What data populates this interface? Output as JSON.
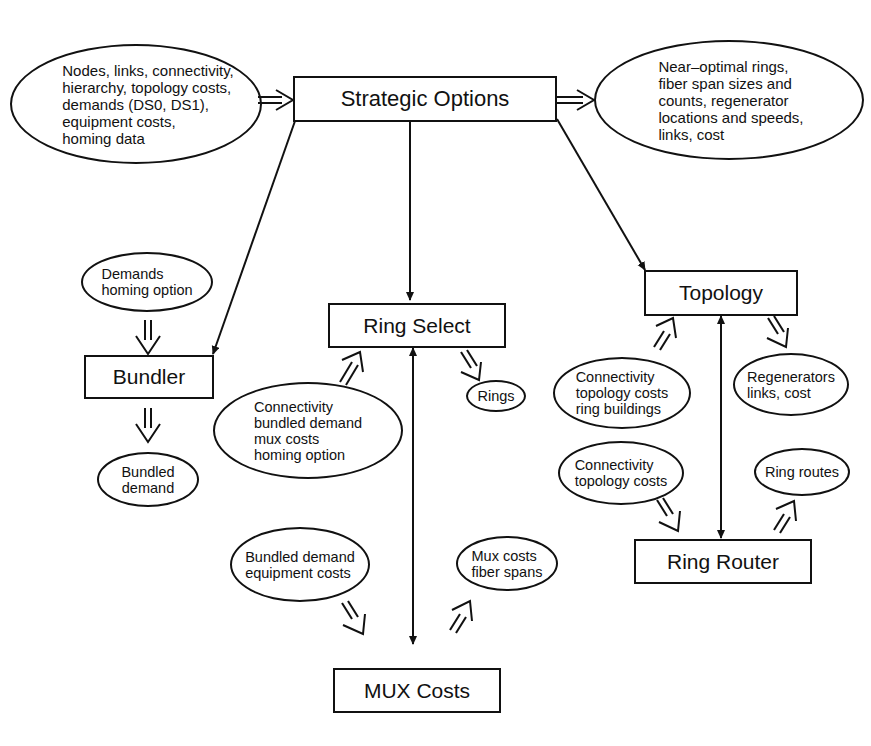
{
  "diagram": {
    "process_boxes": {
      "strategic_options": "Strategic Options",
      "bundler": "Bundler",
      "ring_select": "Ring Select",
      "topology": "Topology",
      "ring_router": "Ring Router",
      "mux_costs": "MUX Costs"
    },
    "data_ellipses": {
      "inputs": "Nodes, links, connectivity,\nhierarchy, topology costs,\ndemands (DS0, DS1),\nequipment costs,\nhoming data",
      "outputs": "Near–optimal rings,\nfiber span sizes and\ncounts, regenerator\nlocations and speeds,\nlinks, cost",
      "bundler_in": "Demands\nhoming option",
      "bundler_out": "Bundled\ndemand",
      "ring_select_in": "Connectivity\nbundled demand\nmux costs\nhoming option",
      "ring_select_out": "Rings",
      "topology_in": "Connectivity\ntopology costs\nring buildings",
      "topology_out": "Regenerators\nlinks, cost",
      "ring_router_in": "Connectivity\ntopology costs",
      "ring_router_out": "Ring routes",
      "mux_in": "Bundled demand\nequipment costs",
      "mux_out": "Mux costs\nfiber spans"
    },
    "colors": {
      "line": "#111111",
      "background": "#ffffff"
    }
  }
}
